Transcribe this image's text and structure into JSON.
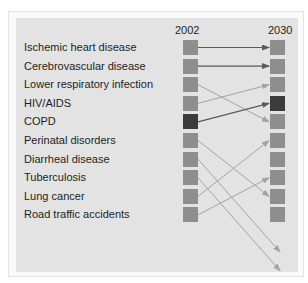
{
  "header": {
    "year_left": "2002",
    "year_right": "2030"
  },
  "colors": {
    "box_default": "#8e8e8e",
    "box_highlight": "#3b3b3b",
    "arrow_dark": "#5a5a5a",
    "arrow_light": "#a3a3a3",
    "panel_bg": "#e3e3e3",
    "text": "#1e1e1e"
  },
  "diseases": [
    {
      "label": "Ischemic heart disease",
      "rank_2002": 1,
      "rank_2030": 1
    },
    {
      "label": "Cerebrovascular disease",
      "rank_2002": 2,
      "rank_2030": 2
    },
    {
      "label": "Lower respiratory infection",
      "rank_2002": 3,
      "rank_2030": 5
    },
    {
      "label": "HIV/AIDS",
      "rank_2002": 4,
      "rank_2030": 3
    },
    {
      "label": "COPD",
      "rank_2002": 5,
      "rank_2030": 4,
      "highlight": true
    },
    {
      "label": "Perinatal disorders",
      "rank_2002": 6,
      "rank_2030": 9
    },
    {
      "label": "Diarrheal disease",
      "rank_2002": 7,
      "rank_2030": 12
    },
    {
      "label": "Tuberculosis",
      "rank_2002": 8,
      "rank_2030": 13
    },
    {
      "label": "Lung cancer",
      "rank_2002": 9,
      "rank_2030": 6
    },
    {
      "label": "Road traffic accidents",
      "rank_2002": 10,
      "rank_2030": 8
    }
  ],
  "right_column_highlight_rank": 4
}
